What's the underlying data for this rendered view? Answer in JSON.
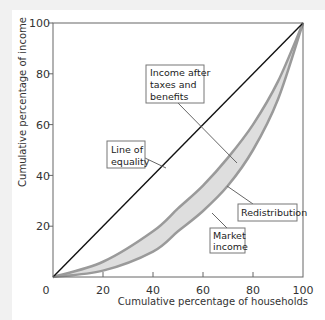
{
  "chart_data": {
    "type": "line",
    "title": "",
    "xlabel": "Cumulative percentage of households",
    "ylabel": "Cumulative percentage of income",
    "xlim": [
      0,
      100
    ],
    "ylim": [
      0,
      100
    ],
    "x_ticks": [
      0,
      20,
      40,
      60,
      80,
      100
    ],
    "y_ticks": [
      20,
      40,
      60,
      80,
      100
    ],
    "grid": false,
    "legend": "none (callout labels)",
    "series": [
      {
        "name": "Line of equality",
        "x": [
          0,
          100
        ],
        "values": [
          0,
          100
        ]
      },
      {
        "name": "Income after taxes and benefits",
        "x": [
          0,
          20,
          40,
          50,
          60,
          70,
          80,
          90,
          100
        ],
        "values": [
          0,
          6,
          18,
          27,
          36,
          47,
          60,
          77,
          100
        ]
      },
      {
        "name": "Market income",
        "x": [
          0,
          20,
          40,
          50,
          60,
          70,
          80,
          90,
          100
        ],
        "values": [
          0,
          2.5,
          10,
          18,
          26,
          36,
          50,
          70,
          100
        ]
      }
    ],
    "shaded_region": "Redistribution",
    "annotations": [
      {
        "text": "Line of equality",
        "lines": [
          "Line of",
          "equality"
        ]
      },
      {
        "text": "Income after taxes and benefits",
        "lines": [
          "Income after",
          "taxes and",
          "benefits"
        ]
      },
      {
        "text": "Redistribution",
        "lines": [
          "Redistribution"
        ]
      },
      {
        "text": "Market income",
        "lines": [
          "Market",
          "income"
        ]
      }
    ]
  },
  "axis": {
    "x_title": "Cumulative percentage of households",
    "y_title": "Cumulative percentage of income",
    "x_tick_labels": [
      "0",
      "20",
      "40",
      "60",
      "80",
      "100"
    ],
    "y_tick_labels": [
      "20",
      "40",
      "60",
      "80",
      "100"
    ]
  },
  "callouts": {
    "equality": [
      "Line of",
      "equality"
    ],
    "after_tax": [
      "Income after",
      "taxes and",
      "benefits"
    ],
    "redistribution": [
      "Redistribution"
    ],
    "market": [
      "Market",
      "income"
    ]
  },
  "colors": {
    "axis": "#555555",
    "equality_line": "#111111",
    "curve_stroke": "#9a9a9a",
    "band_fill": "#dedede",
    "callout_border": "#777777"
  }
}
